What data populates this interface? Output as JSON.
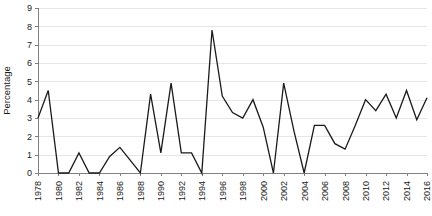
{
  "chart_data": {
    "type": "line",
    "title": "",
    "xlabel": "",
    "ylabel": "Percentage",
    "xlim": [
      1978,
      2016
    ],
    "ylim": [
      0,
      9
    ],
    "ytick_step": 1,
    "xtick_step": 2,
    "grid": true,
    "grid_axis": "y",
    "legend": false,
    "legend_position": "none",
    "yticks": [
      "0",
      "1",
      "2",
      "3",
      "4",
      "5",
      "6",
      "7",
      "8",
      "9"
    ],
    "xticks": [
      "1978",
      "1980",
      "1982",
      "1984",
      "1986",
      "1988",
      "1990",
      "1992",
      "1994",
      "1996",
      "1998",
      "2000",
      "2002",
      "2004",
      "2006",
      "2008",
      "2010",
      "2012",
      "2014",
      "2016"
    ],
    "x": [
      1978,
      1979,
      1980,
      1981,
      1982,
      1983,
      1984,
      1985,
      1986,
      1987,
      1988,
      1989,
      1990,
      1991,
      1992,
      1993,
      1994,
      1995,
      1996,
      1997,
      1998,
      1999,
      2000,
      2001,
      2002,
      2003,
      2004,
      2005,
      2006,
      2007,
      2008,
      2009,
      2010,
      2011,
      2012,
      2013,
      2014,
      2015,
      2016
    ],
    "values": [
      3.0,
      4.5,
      0.0,
      0.0,
      1.1,
      0.0,
      0.0,
      0.9,
      1.4,
      0.7,
      0.0,
      4.3,
      1.1,
      4.9,
      1.1,
      1.1,
      0.0,
      7.8,
      4.2,
      3.3,
      3.0,
      4.0,
      2.5,
      0.0,
      4.9,
      2.3,
      0.0,
      2.6,
      2.6,
      1.6,
      1.3,
      2.6,
      4.0,
      3.4,
      4.3,
      3.0,
      4.5,
      2.9,
      4.1
    ],
    "series": [
      {
        "name": "Percentage",
        "color": "#1a1a1a",
        "line_width": 1.3,
        "values": [
          3.0,
          4.5,
          0.0,
          0.0,
          1.1,
          0.0,
          0.0,
          0.9,
          1.4,
          0.7,
          0.0,
          4.3,
          1.1,
          4.9,
          1.1,
          1.1,
          0.0,
          7.8,
          4.2,
          3.3,
          3.0,
          4.0,
          2.5,
          0.0,
          4.9,
          2.3,
          0.0,
          2.6,
          2.6,
          1.6,
          1.3,
          2.6,
          4.0,
          3.4,
          4.3,
          3.0,
          4.5,
          2.9,
          4.1
        ]
      }
    ],
    "colors": {
      "series_line": "#1a1a1a",
      "gridline": "#e6e6e6",
      "axis": "#808080",
      "text": "#1a1a1a",
      "background": "#ffffff"
    }
  },
  "layout": {
    "plot_left": 38,
    "plot_right": 427,
    "plot_top": 8,
    "plot_bottom": 173
  }
}
